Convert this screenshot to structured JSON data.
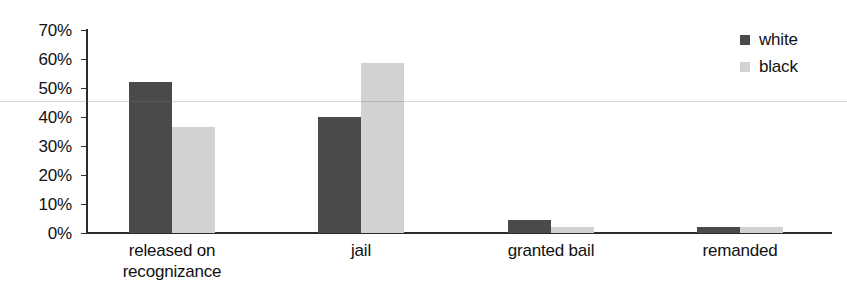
{
  "chart_data": {
    "type": "bar",
    "title": "",
    "xlabel": "",
    "ylabel": "",
    "categories": [
      "released on\nrecognizance",
      "jail",
      "granted bail",
      "remanded"
    ],
    "series": [
      {
        "name": "white",
        "color": "#4a4a4a",
        "values": [
          52,
          40,
          4.5,
          2
        ]
      },
      {
        "name": "black",
        "color": "#d2d2d2",
        "values": [
          36.5,
          58.5,
          2,
          2
        ]
      }
    ],
    "ylim": [
      0,
      70
    ],
    "ytick_values": [
      70,
      60,
      50,
      40,
      30,
      20,
      10,
      0
    ],
    "ytick_labels": [
      "70%",
      "60%",
      "50%",
      "40%",
      "30%",
      "20%",
      "10%",
      "0%"
    ],
    "value_suffix": "%",
    "grid": false,
    "legend_position": "top-right"
  },
  "legend": {
    "entries": [
      {
        "label": "white",
        "color": "#4a4a4a"
      },
      {
        "label": "black",
        "color": "#d2d2d2"
      }
    ]
  }
}
